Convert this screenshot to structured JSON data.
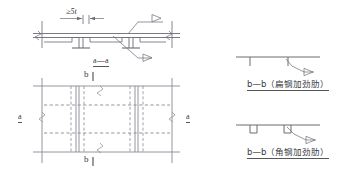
{
  "drawing": {
    "title_hidden": "",
    "stroke_color": "#6b6b75",
    "stroke_color_dark": "#4a4a54",
    "text_color": "#3a3a42",
    "background": "#ffffff"
  },
  "section_aa": {
    "dimension_label": "≥5t",
    "section_label": "a—a",
    "weld_symbol_count": 2
  },
  "plan_view": {
    "section_mark_left": "a",
    "section_mark_right": "a",
    "section_mark_top": "b",
    "section_mark_bottom": "b",
    "break_symbol_count": 4
  },
  "detail_flat": {
    "label": "b—b（扁钢加劲肋）",
    "weld_symbol_count": 1
  },
  "detail_angle": {
    "label": "b—b（角钢加劲肋）",
    "weld_symbol_count": 1
  }
}
